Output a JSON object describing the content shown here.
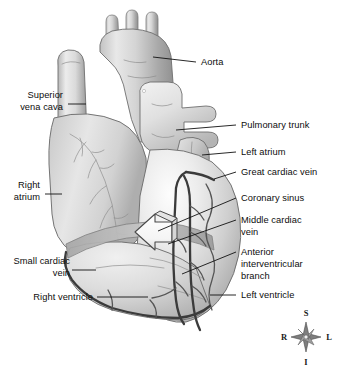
{
  "figure": {
    "background_color": "#ffffff",
    "width": 349,
    "height": 371
  },
  "labels": {
    "aorta": "Aorta",
    "superior_vena_cava_line1": "Superior",
    "superior_vena_cava_line2": "vena cava",
    "pulmonary_trunk": "Pulmonary trunk",
    "left_atrium": "Left atrium",
    "great_cardiac_vein": "Great cardiac vein",
    "right_atrium_line1": "Right",
    "right_atrium_line2": "atrium",
    "coronary_sinus": "Coronary sinus",
    "middle_cardiac_vein_line1": "Middle cardiac",
    "middle_cardiac_vein_line2": "vein",
    "anterior_interventricular_line1": "Anterior",
    "anterior_interventricular_line2": "interventricular",
    "anterior_interventricular_line3": "branch",
    "small_cardiac_vein_line1": "Small cardiac",
    "small_cardiac_vein_line2": "vein",
    "right_ventricle": "Right ventricle",
    "left_ventricle": "Left ventricle"
  },
  "compass": {
    "superior": "S",
    "inferior": "I",
    "right": "R",
    "left": "L"
  },
  "colors": {
    "background": "#ffffff",
    "text": "#0d0d0d",
    "leader_line": "#111111",
    "muscle_light": "#efefef",
    "muscle_mid": "#c9c9c9",
    "muscle_dark": "#a0a0a0",
    "vessel_dark": "#3b3b3b",
    "outline": "#6e6e6e",
    "arrow_fill": "#fbfbfb"
  }
}
